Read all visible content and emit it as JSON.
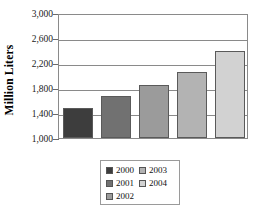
{
  "chart_data": {
    "type": "bar",
    "title": "",
    "subtitle": "",
    "xlabel": "",
    "ylabel": "Million Liters",
    "categories": [
      "2000",
      "2001",
      "2002",
      "2003",
      "2004"
    ],
    "values": [
      1480,
      1680,
      1850,
      2050,
      2400
    ],
    "series": [
      {
        "name": "Million Liters",
        "values": [
          1480,
          1680,
          1850,
          2050,
          2400
        ]
      }
    ],
    "ylim": [
      1000,
      3000
    ],
    "ytick_labels": [
      "3,000",
      "2,600",
      "2,200",
      "1,800",
      "1,400",
      "1,000"
    ],
    "ytick_values": [
      3000,
      2600,
      2200,
      1800,
      1400,
      1000
    ],
    "grid": true,
    "legend_position": "bottom",
    "bar_colors": [
      "#3d3d3d",
      "#717171",
      "#9b9b9b",
      "#b3b3b3",
      "#d2d2d2"
    ],
    "legend": [
      {
        "label": "2000",
        "color": "#3d3d3d"
      },
      {
        "label": "2001",
        "color": "#717171"
      },
      {
        "label": "2002",
        "color": "#9b9b9b"
      },
      {
        "label": "2003",
        "color": "#b3b3b3"
      },
      {
        "label": "2004",
        "color": "#d2d2d2"
      }
    ],
    "legend_columns": [
      [
        {
          "label": "2000",
          "color": "#3d3d3d"
        },
        {
          "label": "2001",
          "color": "#717171"
        },
        {
          "label": "2002",
          "color": "#9b9b9b"
        }
      ],
      [
        {
          "label": "2003",
          "color": "#b3b3b3"
        },
        {
          "label": "2004",
          "color": "#d2d2d2"
        }
      ]
    ]
  }
}
